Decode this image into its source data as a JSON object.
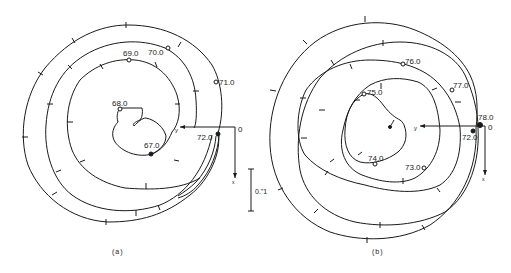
{
  "panel_a": {
    "caption": "(a)",
    "labels": {
      "t68": "68.0",
      "t69": "69.0",
      "t70": "70.0",
      "t71": "71.0",
      "t72": "72.0",
      "t67": "67.0",
      "origin": "0",
      "y_axis": "y",
      "x_axis": "x"
    },
    "scale_bar": "0.\"1"
  },
  "panel_b": {
    "caption": "(b)",
    "labels": {
      "t75": "75.0",
      "t76": "76.0",
      "t77": "77.0",
      "t78": "78.0",
      "t72": "72.0",
      "t74": "74.0",
      "t73": "73.0",
      "origin": "0",
      "y_axis": "y",
      "x_axis": "x"
    }
  }
}
